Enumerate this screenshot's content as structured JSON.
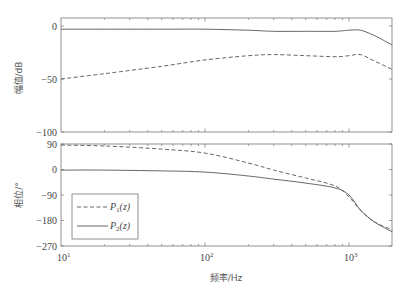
{
  "chart_data": [
    {
      "type": "line",
      "panel": "magnitude",
      "title": "",
      "xlabel": "",
      "ylabel": "幅值/dB",
      "xscale": "log",
      "xlim": [
        10,
        2000
      ],
      "ylim": [
        -100,
        8
      ],
      "yticks": [
        0,
        -50,
        -100
      ],
      "ytick_labels": [
        "0",
        "-50",
        "-100"
      ],
      "grid": false,
      "x": [
        10,
        20,
        50,
        100,
        200,
        300,
        500,
        800,
        1000,
        1200,
        1500,
        2000
      ],
      "series": [
        {
          "name": "P1(z)",
          "style": "dashed",
          "values": [
            -50,
            -45,
            -38,
            -32,
            -28,
            -27,
            -28,
            -29,
            -28,
            -27,
            -33,
            -41
          ]
        },
        {
          "name": "P2(z)",
          "style": "solid",
          "values": [
            -3,
            -3,
            -3,
            -3,
            -4,
            -5,
            -5,
            -5,
            -4,
            -4,
            -9,
            -18
          ]
        }
      ]
    },
    {
      "type": "line",
      "panel": "phase",
      "title": "",
      "xlabel": "频率/Hz",
      "ylabel": "相位/°",
      "xscale": "log",
      "xlim": [
        10,
        2000
      ],
      "ylim": [
        -270,
        90
      ],
      "yticks": [
        90,
        0,
        -90,
        -180,
        -270
      ],
      "ytick_labels": [
        "90",
        "0",
        "-90",
        "-180",
        "-270"
      ],
      "xticks": [
        10,
        100,
        1000
      ],
      "xtick_labels": [
        "10^1",
        "10^2",
        "10^3"
      ],
      "grid": false,
      "legend": {
        "position": "lower left",
        "entries": [
          "P1(z)",
          "P2(z)"
        ]
      },
      "x": [
        10,
        20,
        50,
        100,
        200,
        300,
        500,
        800,
        1000,
        1200,
        1500,
        2000
      ],
      "series": [
        {
          "name": "P1(z)",
          "style": "dashed",
          "values": [
            86,
            83,
            72,
            58,
            23,
            -2,
            -30,
            -58,
            -97,
            -143,
            -185,
            -213
          ]
        },
        {
          "name": "P2(z)",
          "style": "solid",
          "values": [
            -2,
            -2,
            -5,
            -9,
            -23,
            -34,
            -48,
            -65,
            -90,
            -143,
            -185,
            -220
          ]
        }
      ]
    }
  ],
  "labels": {
    "mag_ylabel": "幅值/dB",
    "phase_ylabel": "相位/°",
    "xlabel": "频率/Hz",
    "xtick_base": "10",
    "xtick_exps": [
      "1",
      "2",
      "3"
    ],
    "legend_p1_main": "P",
    "legend_p1_sub": "1",
    "legend_p1_arg": "(z)",
    "legend_p2_main": "P",
    "legend_p2_sub": "2",
    "legend_p2_arg": "(z)"
  },
  "colors": {
    "line": "#555555",
    "axis": "#666666"
  }
}
